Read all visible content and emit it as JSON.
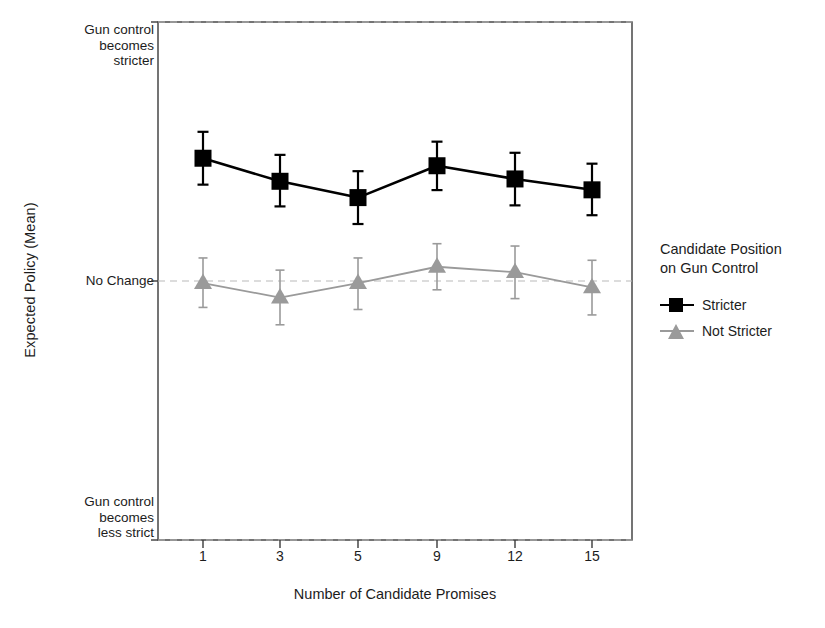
{
  "chart_data": {
    "type": "line",
    "title": "",
    "xlabel": "Number of Candidate Promises",
    "ylabel": "Expected Policy (Mean)",
    "categories": [
      "1",
      "3",
      "5",
      "9",
      "12",
      "15"
    ],
    "x_tick_labels": [
      "1",
      "3",
      "5",
      "9",
      "12",
      "15"
    ],
    "y_tick_labels": [
      "Gun control becomes stricter",
      "No Change",
      "Gun control becomes less strict"
    ],
    "y_tick_lines": [
      [
        "Gun control",
        "becomes",
        "stricter"
      ],
      [
        "No Change"
      ],
      [
        "Gun control",
        "becomes",
        "less strict"
      ]
    ],
    "ylim": [
      -1,
      1
    ],
    "grid": false,
    "reference_lines": [
      1.0,
      0.0,
      -1.0
    ],
    "legend_position": "right",
    "legend_title": [
      "Candidate Position",
      "on Gun Control"
    ],
    "series": [
      {
        "name": "Stricter",
        "marker": "square",
        "color": "#000000",
        "values": [
          0.474,
          0.385,
          0.322,
          0.445,
          0.394,
          0.352
        ],
        "error_low": [
          0.372,
          0.288,
          0.22,
          0.351,
          0.292,
          0.254
        ],
        "error_high": [
          0.576,
          0.487,
          0.424,
          0.538,
          0.495,
          0.453
        ]
      },
      {
        "name": "Not Stricter",
        "marker": "triangle",
        "color": "#9a9a9a",
        "values": [
          -0.008,
          -0.064,
          -0.008,
          0.055,
          0.034,
          -0.025
        ],
        "error_low": [
          -0.102,
          -0.169,
          -0.11,
          -0.034,
          -0.068,
          -0.131
        ],
        "error_high": [
          0.089,
          0.042,
          0.089,
          0.144,
          0.135,
          0.08
        ]
      }
    ]
  },
  "axes": {
    "y_label": "Expected Policy (Mean)",
    "x_label": "Number of Candidate Promises"
  },
  "legend": {
    "title_line1": "Candidate Position",
    "title_line2": "on Gun Control",
    "items": [
      {
        "label": "Stricter",
        "color": "#000000",
        "marker": "square"
      },
      {
        "label": "Not Stricter",
        "color": "#9a9a9a",
        "marker": "triangle"
      }
    ]
  },
  "y_ticks": {
    "top": {
      "line1": "Gun control",
      "line2": "becomes",
      "line3": "stricter"
    },
    "middle": {
      "line1": "No Change"
    },
    "bottom": {
      "line1": "Gun control",
      "line2": "becomes",
      "line3": "less strict"
    }
  },
  "x_ticks": [
    {
      "label": "1"
    },
    {
      "label": "3"
    },
    {
      "label": "5"
    },
    {
      "label": "9"
    },
    {
      "label": "12"
    },
    {
      "label": "15"
    }
  ],
  "colors": {
    "stricter": "#000000",
    "not_stricter": "#9a9a9a",
    "frame": "#3a3a3a",
    "reference_line": "#b9b9b9",
    "background": "#ffffff"
  }
}
